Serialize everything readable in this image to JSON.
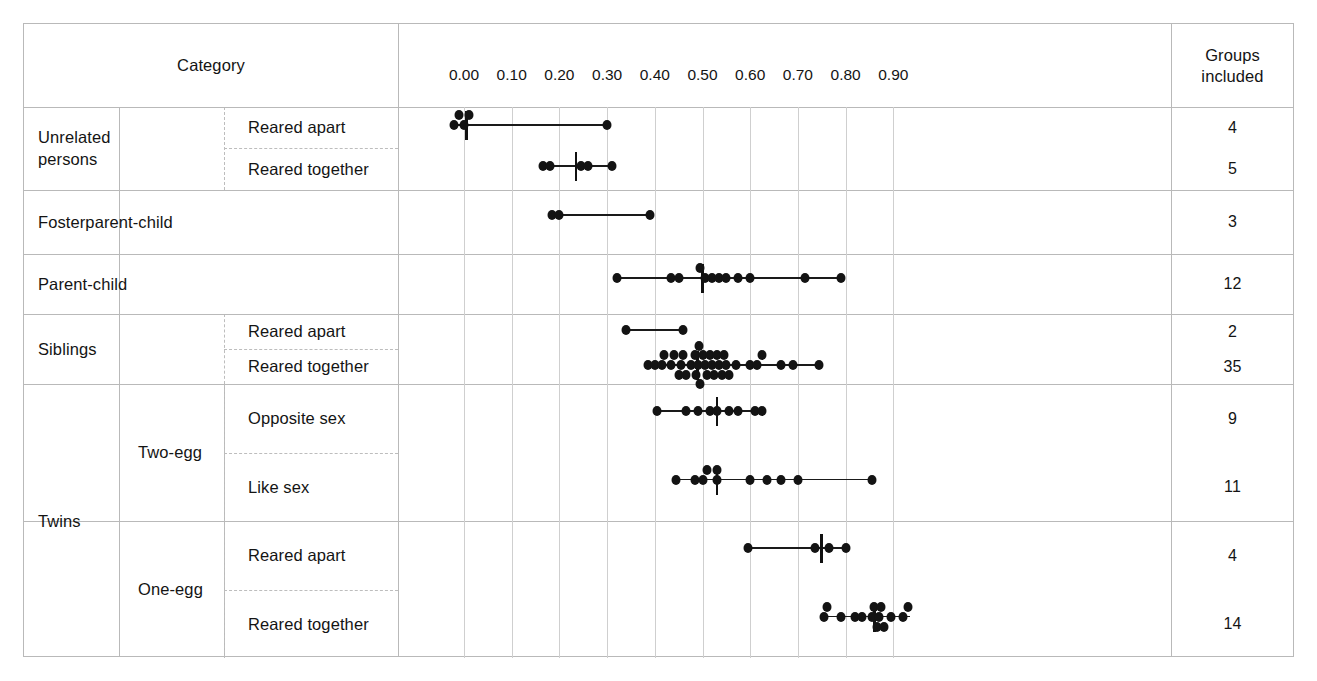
{
  "table": {
    "headers": {
      "category": "Category",
      "groups": "Groups\nincluded",
      "groups_line1": "Groups",
      "groups_line2": "included"
    },
    "groups_label": "Groups",
    "included_label": "included",
    "col1": [
      {
        "label": "Unrelated persons",
        "line1": "Unrelated",
        "line2": "persons"
      },
      {
        "label": "Fosterparent-child"
      },
      {
        "label": "Parent-child"
      },
      {
        "label": "Siblings"
      },
      {
        "label": "Twins"
      }
    ],
    "col2": [
      {
        "label": "Two-egg"
      },
      {
        "label": "One-egg"
      }
    ],
    "col3": [
      {
        "label": "Reared apart"
      },
      {
        "label": "Reared together"
      },
      {
        "label": "Reared apart"
      },
      {
        "label": "Reared together"
      },
      {
        "label": "Opposite sex"
      },
      {
        "label": "Like sex"
      },
      {
        "label": "Reared apart"
      },
      {
        "label": "Reared together"
      }
    ]
  },
  "chart_data": {
    "type": "scatter",
    "title": "",
    "xlabel": "",
    "ylabel": "",
    "xlim": [
      -0.04,
      0.98
    ],
    "grid": true,
    "legend": "none",
    "tick_labels": [
      "0.00",
      "0.10",
      "0.20",
      "0.30",
      "0.40",
      "0.50",
      "0.60",
      "0.70",
      "0.80",
      "0.90"
    ],
    "tick_values": [
      0.0,
      0.1,
      0.2,
      0.3,
      0.4,
      0.5,
      0.6,
      0.7,
      0.8,
      0.9
    ],
    "rows": [
      {
        "category": "Unrelated persons",
        "subcategory": "Reared apart",
        "groups_included": 4,
        "range": [
          -0.02,
          0.3
        ],
        "median": 0.005,
        "values": [
          -0.02,
          -0.01,
          0.0,
          0.01,
          0.3
        ]
      },
      {
        "category": "Unrelated persons",
        "subcategory": "Reared together",
        "groups_included": 5,
        "range": [
          0.17,
          0.31
        ],
        "median": 0.235,
        "values": [
          0.165,
          0.18,
          0.245,
          0.26,
          0.31
        ]
      },
      {
        "category": "Fosterparent-child",
        "subcategory": "",
        "groups_included": 3,
        "range": [
          0.185,
          0.39
        ],
        "median": null,
        "values": [
          0.185,
          0.2,
          0.39
        ]
      },
      {
        "category": "Parent-child",
        "subcategory": "",
        "groups_included": 12,
        "range": [
          0.32,
          0.79
        ],
        "median": 0.5,
        "values": [
          0.32,
          0.435,
          0.45,
          0.505,
          0.495,
          0.52,
          0.535,
          0.55,
          0.575,
          0.6,
          0.715,
          0.79
        ]
      },
      {
        "category": "Siblings",
        "subcategory": "Reared apart",
        "groups_included": 2,
        "range": [
          0.34,
          0.46
        ],
        "median": null,
        "values": [
          0.34,
          0.46
        ]
      },
      {
        "category": "Siblings",
        "subcategory": "Reared together",
        "groups_included": 35,
        "range": [
          0.385,
          0.75
        ],
        "median": 0.49,
        "values": [
          0.385,
          0.4,
          0.415,
          0.42,
          0.435,
          0.44,
          0.455,
          0.46,
          0.465,
          0.475,
          0.485,
          0.487,
          0.49,
          0.492,
          0.495,
          0.5,
          0.505,
          0.51,
          0.515,
          0.52,
          0.525,
          0.53,
          0.535,
          0.54,
          0.545,
          0.55,
          0.555,
          0.57,
          0.6,
          0.615,
          0.625,
          0.665,
          0.69,
          0.745,
          0.45
        ]
      },
      {
        "category": "Twins / Two-egg",
        "subcategory": "Opposite sex",
        "groups_included": 9,
        "range": [
          0.405,
          0.625
        ],
        "median": 0.53,
        "values": [
          0.405,
          0.465,
          0.49,
          0.515,
          0.53,
          0.555,
          0.575,
          0.61,
          0.625
        ]
      },
      {
        "category": "Twins / Two-egg",
        "subcategory": "Like sex",
        "groups_included": 11,
        "range": [
          0.445,
          0.855
        ],
        "median": 0.53,
        "values": [
          0.445,
          0.485,
          0.5,
          0.51,
          0.53,
          0.6,
          0.635,
          0.665,
          0.7,
          0.855,
          0.53
        ]
      },
      {
        "category": "Twins / One-egg",
        "subcategory": "Reared apart",
        "groups_included": 4,
        "range": [
          0.595,
          0.8
        ],
        "median": 0.75,
        "values": [
          0.595,
          0.735,
          0.765,
          0.8
        ]
      },
      {
        "category": "Twins / One-egg",
        "subcategory": "Reared together",
        "groups_included": 14,
        "range": [
          0.755,
          0.935
        ],
        "median": 0.86,
        "values": [
          0.755,
          0.76,
          0.79,
          0.82,
          0.835,
          0.855,
          0.86,
          0.865,
          0.87,
          0.875,
          0.88,
          0.895,
          0.92,
          0.93
        ]
      }
    ]
  },
  "colors": {
    "border": "#b9b9b9",
    "gridline": "#cfcfcf",
    "point": "#131313",
    "text": "#141414",
    "background": "#ffffff"
  }
}
